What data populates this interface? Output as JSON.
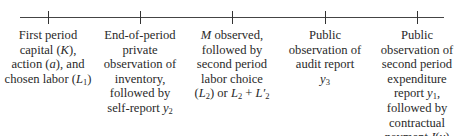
{
  "diagram": {
    "type": "timeline",
    "axis": {
      "x_start": 20,
      "x_end": 444,
      "y": 17,
      "color": "#444444"
    },
    "events": [
      {
        "x": 48,
        "lines": [
          [
            {
              "t": "First period"
            }
          ],
          [
            {
              "t": "capital ("
            },
            {
              "t": "K",
              "i": true
            },
            {
              "t": "),"
            }
          ],
          [
            {
              "t": "action ("
            },
            {
              "t": "a",
              "i": true
            },
            {
              "t": "), and"
            }
          ],
          [
            {
              "t": "chosen labor ("
            },
            {
              "t": "L",
              "i": true
            },
            {
              "t": "1",
              "sub": true
            },
            {
              "t": ")"
            }
          ]
        ],
        "text": "First period capital (K), action (a), and chosen labor (L1)"
      },
      {
        "x": 140,
        "lines": [
          [
            {
              "t": "End-of-period"
            }
          ],
          [
            {
              "t": "private"
            }
          ],
          [
            {
              "t": "observation of"
            }
          ],
          [
            {
              "t": "inventory,"
            }
          ],
          [
            {
              "t": "followed by"
            }
          ],
          [
            {
              "t": "self-report "
            },
            {
              "t": "y",
              "i": true
            },
            {
              "t": "2",
              "sub": true
            }
          ]
        ],
        "text": "End-of-period private observation of inventory, followed by self-report y2"
      },
      {
        "x": 232,
        "lines": [
          [
            {
              "t": "M",
              "i": true
            },
            {
              "t": " observed,"
            }
          ],
          [
            {
              "t": "followed by"
            }
          ],
          [
            {
              "t": "second period"
            }
          ],
          [
            {
              "t": "labor choice"
            }
          ],
          [
            {
              "t": "("
            },
            {
              "t": "L",
              "i": true
            },
            {
              "t": "2",
              "sub": true
            },
            {
              "t": ") or "
            },
            {
              "t": "L",
              "i": true
            },
            {
              "t": "2",
              "sub": true
            },
            {
              "t": " + "
            },
            {
              "t": "L",
              "i": true
            },
            {
              "t": "′",
              "i": true
            },
            {
              "t": "2",
              "sub": true
            }
          ]
        ],
        "text": "M observed, followed by second period labor choice (L2) or L2 + L2'"
      },
      {
        "x": 325,
        "lines": [
          [
            {
              "t": "Public"
            }
          ],
          [
            {
              "t": "observation of"
            }
          ],
          [
            {
              "t": "audit report"
            }
          ],
          [
            {
              "t": "y",
              "i": true
            },
            {
              "t": "3",
              "sub": true
            }
          ]
        ],
        "text": "Public observation of audit report y3"
      },
      {
        "x": 417,
        "lines": [
          [
            {
              "t": "Public"
            }
          ],
          [
            {
              "t": "observation of"
            }
          ],
          [
            {
              "t": "second period"
            }
          ],
          [
            {
              "t": "expenditure"
            }
          ],
          [
            {
              "t": "report "
            },
            {
              "t": "y",
              "i": true
            },
            {
              "t": "1",
              "sub": true
            },
            {
              "t": ","
            }
          ],
          [
            {
              "t": "followed by"
            }
          ],
          [
            {
              "t": "contractual"
            }
          ],
          [
            {
              "t": "payment "
            },
            {
              "t": "I",
              "i": true
            },
            {
              "t": "("
            },
            {
              "t": "y",
              "i": true
            },
            {
              "t": ")"
            }
          ]
        ],
        "text": "Public observation of second period expenditure report y1, followed by contractual payment I(y)"
      }
    ]
  }
}
